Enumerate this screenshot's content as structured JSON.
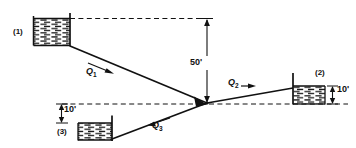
{
  "figure": {
    "type": "three-reservoir-pipe-network-diagram",
    "stroke_color": "#111111",
    "water_color": "#111111",
    "background": "#ffffff"
  },
  "reservoirs": [
    {
      "id": "r1",
      "label": "(1)",
      "position": "upper-left",
      "surface_elevation_ft": 50,
      "label_x": 13,
      "label_y": 28
    },
    {
      "id": "r2",
      "label": "(2)",
      "position": "right",
      "surface_elevation_ft": 10,
      "label_x": 315,
      "label_y": 69
    },
    {
      "id": "r3",
      "label": "(3)",
      "position": "lower-left",
      "surface_elevation_ft": 0,
      "label_x": 57,
      "label_y": 128
    }
  ],
  "dimensions": [
    {
      "id": "d50",
      "text": "50",
      "unit": "'",
      "value": 50,
      "orientation": "vertical",
      "label_x": 190,
      "label_y": 58,
      "describes": "head difference between reservoir 1 surface and junction datum"
    },
    {
      "id": "d10-right",
      "text": "10",
      "unit": "'",
      "value": 10,
      "orientation": "vertical",
      "label_x": 337,
      "label_y": 86,
      "describes": "depth of reservoir 2 above datum"
    },
    {
      "id": "d10-left",
      "text": "10",
      "unit": "'",
      "value": 10,
      "orientation": "vertical",
      "label_x": 64,
      "label_y": 105,
      "describes": "drop from datum to reservoir 3 surface"
    }
  ],
  "flows": [
    {
      "id": "q1",
      "symbol": "Q",
      "subscript": "1",
      "direction": "from reservoir 1 toward junction",
      "label_x": 86,
      "label_y": 68
    },
    {
      "id": "q2",
      "symbol": "Q",
      "subscript": "2",
      "direction": "from junction toward reservoir 2",
      "label_x": 228,
      "label_y": 79
    },
    {
      "id": "q3",
      "symbol": "Q",
      "subscript": "3",
      "direction": "from junction toward reservoir 3",
      "label_x": 152,
      "label_y": 122
    }
  ],
  "datum_lines": [
    {
      "id": "upper-datum",
      "style": "dashed",
      "from_x": 70,
      "to_x": 210,
      "y": 18,
      "describes": "reservoir 1 water surface level extended"
    },
    {
      "id": "lower-datum",
      "style": "dashed",
      "from_x": 62,
      "to_x": 348,
      "y": 104,
      "describes": "junction datum level extended to both sides"
    }
  ],
  "junction": {
    "id": "junction-node",
    "x": 207,
    "y": 103,
    "label": "pipe junction"
  }
}
